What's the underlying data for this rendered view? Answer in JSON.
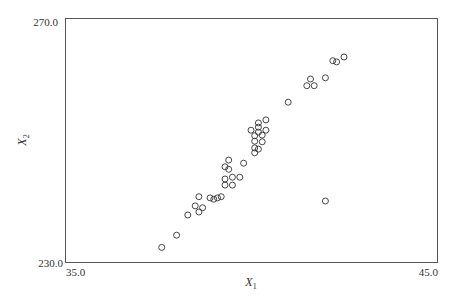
{
  "chart_data": {
    "type": "scatter",
    "title": "",
    "xlabel": "X",
    "xlabel_subscript": "1",
    "ylabel": "X",
    "ylabel_subscript": "2",
    "xlim": [
      35.0,
      45.0
    ],
    "ylim": [
      230.0,
      270.0
    ],
    "x_tick_labels": [
      "35.0",
      "45.0"
    ],
    "y_tick_labels": [
      "270.0",
      "230.0"
    ],
    "grid": false,
    "legend": null,
    "marker": "open-circle",
    "points": [
      [
        37.6,
        232.4
      ],
      [
        38.0,
        234.4
      ],
      [
        38.3,
        237.7
      ],
      [
        38.5,
        239.2
      ],
      [
        38.6,
        240.7
      ],
      [
        38.6,
        238.2
      ],
      [
        38.7,
        238.9
      ],
      [
        38.9,
        240.5
      ],
      [
        39.0,
        240.3
      ],
      [
        39.1,
        240.5
      ],
      [
        39.2,
        240.7
      ],
      [
        39.3,
        243.6
      ],
      [
        39.3,
        242.6
      ],
      [
        39.3,
        245.6
      ],
      [
        39.4,
        245.2
      ],
      [
        39.4,
        246.7
      ],
      [
        39.5,
        243.9
      ],
      [
        39.5,
        242.6
      ],
      [
        39.7,
        243.9
      ],
      [
        39.8,
        246.2
      ],
      [
        40.0,
        251.6
      ],
      [
        40.1,
        247.9
      ],
      [
        40.1,
        248.7
      ],
      [
        40.1,
        249.8
      ],
      [
        40.1,
        250.7
      ],
      [
        40.2,
        248.5
      ],
      [
        40.2,
        252.8
      ],
      [
        40.2,
        252.1
      ],
      [
        40.2,
        251.3
      ],
      [
        40.3,
        249.7
      ],
      [
        40.3,
        250.8
      ],
      [
        40.4,
        253.3
      ],
      [
        40.4,
        251.6
      ],
      [
        41.0,
        256.2
      ],
      [
        41.5,
        258.9
      ],
      [
        41.6,
        260.0
      ],
      [
        41.7,
        258.9
      ],
      [
        42.0,
        260.2
      ],
      [
        42.0,
        240.0
      ],
      [
        42.2,
        263.0
      ],
      [
        42.3,
        262.8
      ],
      [
        42.5,
        263.6
      ]
    ]
  },
  "plot": {
    "left_px": 65,
    "top_px": 18,
    "right_px": 437,
    "bottom_px": 262,
    "frame_color": "#555555",
    "marker_color": "#333333",
    "marker_radius": 3
  }
}
